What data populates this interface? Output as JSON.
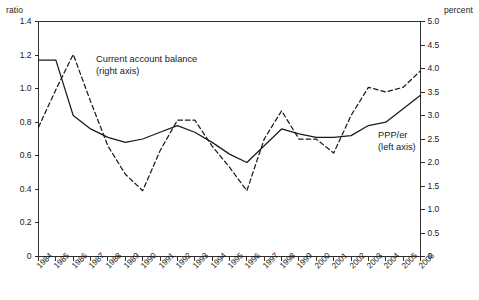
{
  "chart_data": {
    "type": "line",
    "title": "",
    "xlabel": "",
    "grid": false,
    "legend_position": "inline-annotations",
    "categories": [
      "1984",
      "1985",
      "1986",
      "1987",
      "1988",
      "1989",
      "1990",
      "1991",
      "1992",
      "1993",
      "1994",
      "1995",
      "1996",
      "1997",
      "1998",
      "1999",
      "2000",
      "2001",
      "2002",
      "2003",
      "2004",
      "2005",
      "2006"
    ],
    "axes": {
      "left": {
        "unit_label": "ratio",
        "ylabel": "ratio",
        "ylim": [
          0,
          1.4
        ],
        "tick_step": 0.2,
        "ticks": [
          "0",
          "0.2",
          "0.4",
          "0.6",
          "0.8",
          "1.0",
          "1.2",
          "1.4"
        ]
      },
      "right": {
        "unit_label": "percent",
        "ylabel": "percent",
        "ylim": [
          0,
          5.0
        ],
        "tick_step": 0.5,
        "ticks": [
          "0",
          "0.5",
          "1.0",
          "1.5",
          "2.0",
          "2.5",
          "3.0",
          "3.5",
          "4.0",
          "4.5",
          "5.0"
        ]
      }
    },
    "series": [
      {
        "name": "PPP/er",
        "axis": "left",
        "style": "solid",
        "color": "#1a1a1a",
        "annotation_line1": "PPP/er",
        "annotation_line2": "(left axis)",
        "values": [
          1.17,
          1.17,
          0.84,
          0.76,
          0.71,
          0.68,
          0.7,
          0.74,
          0.78,
          0.74,
          0.68,
          0.61,
          0.56,
          0.66,
          0.76,
          0.73,
          0.71,
          0.71,
          0.72,
          0.78,
          0.8,
          0.88,
          0.96
        ]
      },
      {
        "name": "Current account balance",
        "axis": "right",
        "style": "dashed",
        "color": "#1a1a1a",
        "annotation_line1": "Current account balance",
        "annotation_line2": "(right axis)",
        "values": [
          2.75,
          3.55,
          4.3,
          3.3,
          2.35,
          1.75,
          1.4,
          2.25,
          2.9,
          2.9,
          2.35,
          1.9,
          1.4,
          2.5,
          3.1,
          2.5,
          2.5,
          2.2,
          3.0,
          3.6,
          3.5,
          3.6,
          3.95
        ]
      }
    ]
  }
}
